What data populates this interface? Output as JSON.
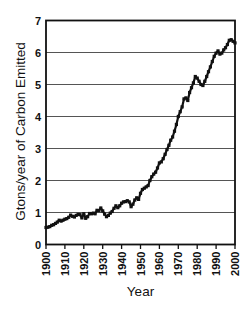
{
  "chart_data": {
    "type": "line",
    "title": "",
    "xlabel": "Year",
    "ylabel": "Gtons/year of Carbon Emitted",
    "xlim": [
      1900,
      2000
    ],
    "ylim": [
      0,
      7
    ],
    "x_ticks": [
      1900,
      1910,
      1920,
      1930,
      1940,
      1950,
      1960,
      1970,
      1980,
      1990,
      2000
    ],
    "y_ticks": [
      0,
      1,
      2,
      3,
      4,
      5,
      6,
      7
    ],
    "grid": "horizontal-y",
    "legend": "none",
    "marker": "square",
    "colors": {
      "line": "#111111",
      "grid": "#555555",
      "frame": "#111111",
      "text": "#111111",
      "background": "#ffffff"
    },
    "series": [
      {
        "name": "global-carbon-emissions",
        "x": [
          1900,
          1901,
          1902,
          1903,
          1904,
          1905,
          1906,
          1907,
          1908,
          1909,
          1910,
          1911,
          1912,
          1913,
          1914,
          1915,
          1916,
          1917,
          1918,
          1919,
          1920,
          1921,
          1922,
          1923,
          1924,
          1925,
          1926,
          1927,
          1928,
          1929,
          1930,
          1931,
          1932,
          1933,
          1934,
          1935,
          1936,
          1937,
          1938,
          1939,
          1940,
          1941,
          1942,
          1943,
          1944,
          1945,
          1946,
          1947,
          1948,
          1949,
          1950,
          1951,
          1952,
          1953,
          1954,
          1955,
          1956,
          1957,
          1958,
          1959,
          1960,
          1961,
          1962,
          1963,
          1964,
          1965,
          1966,
          1967,
          1968,
          1969,
          1970,
          1971,
          1972,
          1973,
          1974,
          1975,
          1976,
          1977,
          1978,
          1979,
          1980,
          1981,
          1982,
          1983,
          1984,
          1985,
          1986,
          1987,
          1988,
          1989,
          1990,
          1991,
          1992,
          1993,
          1994,
          1995,
          1996,
          1997,
          1998,
          1999,
          2000
        ],
        "values": [
          0.53,
          0.54,
          0.56,
          0.6,
          0.62,
          0.66,
          0.7,
          0.76,
          0.73,
          0.76,
          0.79,
          0.81,
          0.85,
          0.92,
          0.88,
          0.86,
          0.91,
          0.94,
          0.93,
          0.83,
          0.96,
          0.82,
          0.87,
          0.97,
          0.96,
          0.98,
          0.96,
          1.07,
          1.06,
          1.14,
          1.05,
          0.95,
          0.87,
          0.91,
          0.98,
          1.03,
          1.13,
          1.21,
          1.15,
          1.21,
          1.29,
          1.33,
          1.34,
          1.37,
          1.33,
          1.18,
          1.26,
          1.39,
          1.46,
          1.41,
          1.6,
          1.72,
          1.76,
          1.8,
          1.84,
          2.0,
          2.12,
          2.2,
          2.26,
          2.39,
          2.55,
          2.58,
          2.68,
          2.82,
          2.97,
          3.1,
          3.26,
          3.36,
          3.54,
          3.75,
          4.0,
          4.15,
          4.3,
          4.55,
          4.58,
          4.5,
          4.75,
          4.9,
          5.05,
          5.25,
          5.2,
          5.1,
          5.0,
          4.97,
          5.1,
          5.25,
          5.4,
          5.55,
          5.72,
          5.88,
          5.98,
          6.05,
          5.95,
          5.98,
          6.08,
          6.15,
          6.25,
          6.38,
          6.4,
          6.35,
          6.3
        ]
      }
    ]
  }
}
